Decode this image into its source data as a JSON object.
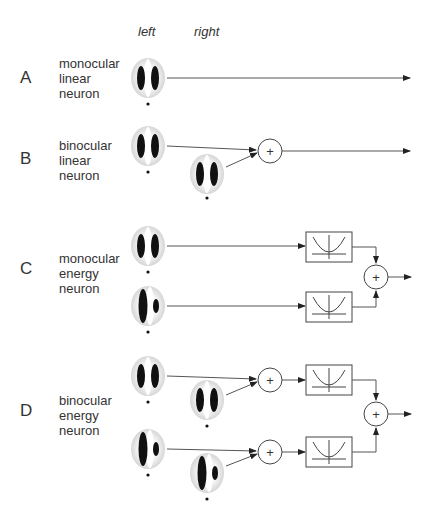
{
  "header": {
    "left": "left",
    "right": "right"
  },
  "rows": [
    {
      "letter": "A",
      "lines": [
        "monocular",
        "linear",
        "neuron"
      ]
    },
    {
      "letter": "B",
      "lines": [
        "binocular",
        "linear",
        "neuron"
      ]
    },
    {
      "letter": "C",
      "lines": [
        "monocular",
        "energy",
        "neuron"
      ]
    },
    {
      "letter": "D",
      "lines": [
        "binocular",
        "energy",
        "neuron"
      ]
    }
  ],
  "symbols": {
    "sum": "+",
    "nonlinearity": "squaring"
  },
  "colors": {
    "line": "#555555",
    "stroke": "#444444",
    "blob": "#111111",
    "halo": "#d8d8d8"
  }
}
